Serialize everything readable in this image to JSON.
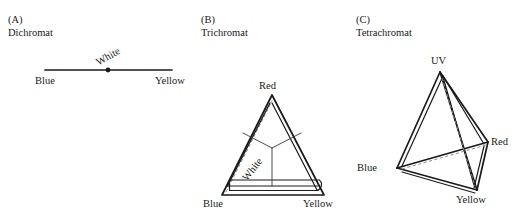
{
  "figure": {
    "background_color": "#ffffff",
    "line_color": "#1a1a1a",
    "dashed_line_color": "#8a8a8a",
    "thin_line_color": "#3a3a3a"
  },
  "panels": [
    {
      "id": "a",
      "letter": "(A)",
      "name": "Dichromat",
      "shape": "line-segment",
      "vertices": [
        {
          "label": "Blue",
          "x": 45,
          "y": 70
        },
        {
          "label": "Yellow",
          "x": 172,
          "y": 70
        }
      ],
      "center": {
        "label": "White",
        "x": 108,
        "y": 70,
        "rotation_deg": -30
      }
    },
    {
      "id": "b",
      "letter": "(B)",
      "name": "Trichromat",
      "shape": "triangle",
      "vertices": [
        {
          "label": "Red",
          "x": 272,
          "y": 95
        },
        {
          "label": "Blue",
          "x": 222,
          "y": 195
        },
        {
          "label": "Yellow",
          "x": 324,
          "y": 195
        }
      ],
      "center": {
        "label": "White",
        "x": 265,
        "y": 168,
        "rotation_deg": -52
      }
    },
    {
      "id": "c",
      "letter": "(C)",
      "name": "Tetrachromat",
      "shape": "tetrahedron",
      "vertices": [
        {
          "label": "UV",
          "x": 440,
          "y": 72
        },
        {
          "label": "Red",
          "x": 488,
          "y": 142
        },
        {
          "label": "Blue",
          "x": 397,
          "y": 168
        },
        {
          "label": "Yellow",
          "x": 477,
          "y": 190
        }
      ]
    }
  ],
  "labels": {
    "blue": "Blue",
    "yellow": "Yellow",
    "red": "Red",
    "uv": "UV",
    "white": "White"
  }
}
